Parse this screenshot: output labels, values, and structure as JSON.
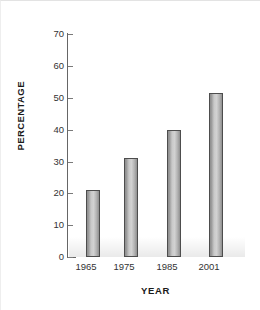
{
  "chart_data": {
    "type": "bar",
    "title": "",
    "xlabel": "YEAR",
    "ylabel": "PERCENTAGE",
    "categories": [
      "1965",
      "1975",
      "1985",
      "2001"
    ],
    "values": [
      21,
      31,
      40,
      51.5
    ],
    "series": [
      {
        "name": "Percentage",
        "values": [
          21,
          31,
          40,
          51.5
        ]
      }
    ],
    "ylim": [
      0,
      70
    ],
    "ytick_step": 10,
    "yticks": [
      "0",
      "10",
      "20",
      "30",
      "40",
      "50",
      "60",
      "70"
    ],
    "xlim_categories": 4,
    "grid": false,
    "legend": false,
    "legend_position": "none",
    "bar_fill_color": "#c9c9c9",
    "bar_edge_color": "#4d4d4d",
    "axis_color": "#666666",
    "text_color": "#333333",
    "background_color": "#ffffff"
  }
}
